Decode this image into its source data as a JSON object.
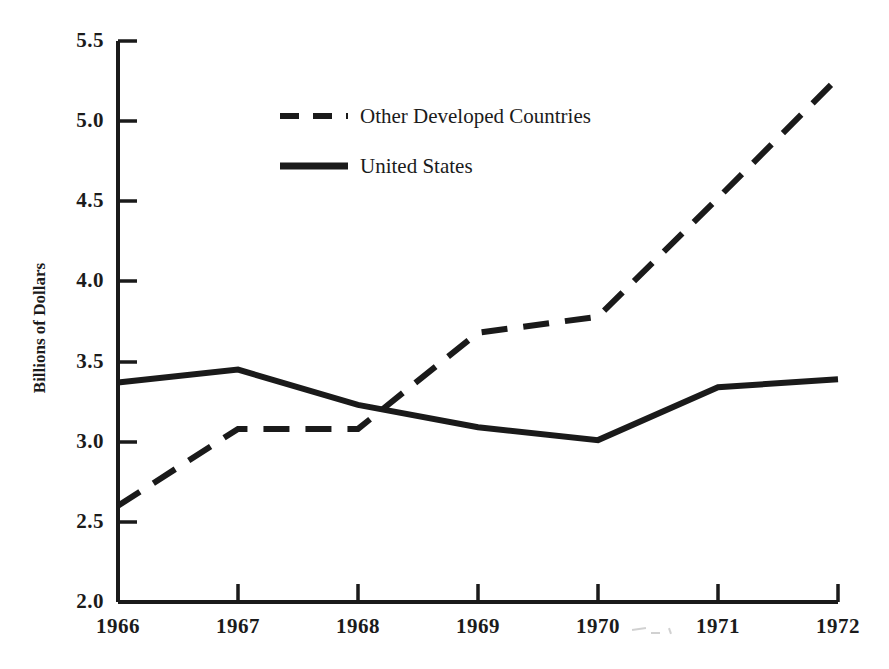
{
  "chart_data": {
    "type": "line",
    "title": "",
    "xlabel": "",
    "ylabel": "Billions of Dollars",
    "categories": [
      "1966",
      "1967",
      "1968",
      "1969",
      "1970",
      "1971",
      "1972"
    ],
    "x": [
      1966,
      1967,
      1968,
      1969,
      1970,
      1971,
      1972
    ],
    "xlim": [
      1966,
      1972
    ],
    "ylim": [
      2.0,
      5.5
    ],
    "ytick_labels": [
      "2.0",
      "2.5",
      "3.0",
      "3.5",
      "4.0",
      "4.5",
      "5.0",
      "5.5"
    ],
    "ytick_values": [
      2.0,
      2.5,
      3.0,
      3.5,
      4.0,
      4.5,
      5.0,
      5.5
    ],
    "xtick_labels": [
      "1966",
      "1967",
      "1968",
      "1969",
      "1970",
      "1971",
      "1972"
    ],
    "grid": false,
    "legend_position": "upper-left-inside",
    "series": [
      {
        "name": "Other Developed Countries",
        "style": "dashed",
        "color": "#1a1a1a",
        "values": [
          2.6,
          3.08,
          3.08,
          3.68,
          3.78,
          4.52,
          5.27
        ]
      },
      {
        "name": "United States",
        "style": "solid",
        "color": "#1a1a1a",
        "values": [
          3.37,
          3.45,
          3.23,
          3.09,
          3.01,
          3.34,
          3.39
        ]
      }
    ],
    "annotations": []
  },
  "axis": {
    "y_label": "Billions of Dollars",
    "y_ticks": [
      "5.5",
      "5.0",
      "4.5",
      "4.0",
      "3.5",
      "3.0",
      "2.5",
      "2.0"
    ],
    "x_ticks": [
      "1966",
      "1967",
      "1968",
      "1969",
      "1970",
      "1971",
      "1972"
    ]
  },
  "legend": {
    "entries": [
      {
        "label": "Other Developed Countries",
        "style": "dashed"
      },
      {
        "label": "United States",
        "style": "solid"
      }
    ]
  },
  "colors": {
    "ink": "#1a1a1a",
    "background": "#ffffff",
    "artifact": "#b9b9b9"
  }
}
